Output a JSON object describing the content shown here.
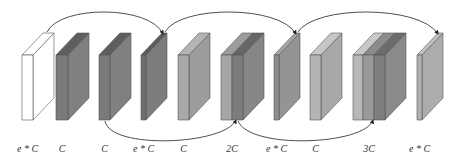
{
  "diagram": {
    "blocks": [
      {
        "id": "b1",
        "label": "e * C",
        "x": 22,
        "slabs": [
          {
            "w": 11,
            "front": "#ffffff",
            "side": "#ffffff",
            "top": "#ffffff"
          }
        ]
      },
      {
        "id": "b2",
        "label": "C",
        "x": 56,
        "slabs": [
          {
            "w": 12,
            "front": "#7a7a7a",
            "side": "#808080",
            "top": "#5e5e5e"
          }
        ]
      },
      {
        "id": "b3",
        "label": "C",
        "x": 99,
        "slabs": [
          {
            "w": 11,
            "front": "#7a7a7a",
            "side": "#808080",
            "top": "#5e5e5e"
          }
        ]
      },
      {
        "id": "b4",
        "label": "e * C",
        "x": 141,
        "slabs": [
          {
            "w": 5,
            "front": "#6e6e6e",
            "side": "#7c7c7c",
            "top": "#5a5a5a"
          }
        ]
      },
      {
        "id": "b5",
        "label": "C",
        "x": 178,
        "slabs": [
          {
            "w": 11,
            "front": "#a8a8a8",
            "side": "#9c9c9c",
            "top": "#b4b4b4"
          }
        ]
      },
      {
        "id": "b6",
        "label": "2C",
        "x": 221,
        "slabs": [
          {
            "w": 11,
            "front": "#a6a6a6",
            "side": "#8c8c8c",
            "top": "#9c9c9c"
          },
          {
            "w": 11,
            "front": "#7c7c7c",
            "side": "#868686",
            "top": "#666666"
          }
        ]
      },
      {
        "id": "b7",
        "label": "e * C",
        "x": 274,
        "slabs": [
          {
            "w": 5,
            "front": "#8e8e8e",
            "side": "#949494",
            "top": "#a4a4a4"
          }
        ]
      },
      {
        "id": "b8",
        "label": "C",
        "x": 310,
        "slabs": [
          {
            "w": 11,
            "front": "#b4b4b4",
            "side": "#a8a8a8",
            "top": "#c6c6c6"
          }
        ]
      },
      {
        "id": "b9",
        "label": "3C",
        "x": 353,
        "slabs": [
          {
            "w": 10,
            "front": "#b8b8b8",
            "side": "#8a8a8a",
            "top": "#c8c8c8"
          },
          {
            "w": 11,
            "front": "#9a9a9a",
            "side": "#8a8a8a",
            "top": "#8c8c8c"
          },
          {
            "w": 11,
            "front": "#7e7e7e",
            "side": "#8a8a8a",
            "top": "#6c6c6c"
          }
        ]
      },
      {
        "id": "b10",
        "label": "e * C",
        "x": 417,
        "slabs": [
          {
            "w": 5,
            "front": "#b0b0b0",
            "side": "#acacac",
            "top": "#c2c2c2"
          }
        ]
      }
    ],
    "geometry": {
      "front_top": 55,
      "front_bottom": 120,
      "depth_dx": 21,
      "depth_dy": -22
    },
    "top_arrows": [
      {
        "from": "b1",
        "to": "b4",
        "path": "M 47 32 C 60 5, 150 5, 163 34"
      },
      {
        "from": "b4",
        "to": "b7",
        "path": "M 165 32 C 180 5, 280 5, 296 34"
      },
      {
        "from": "b7",
        "to": "b10",
        "path": "M 298 32 C 315 5, 420 5, 438 34"
      }
    ],
    "bottom_arrows": [
      {
        "from": "b3",
        "to": "b6",
        "path": "M 105 121 C 110 150, 225 145, 236 120"
      },
      {
        "from": "b6",
        "to": "b9",
        "path": "M 238 121 C 250 150, 365 145, 373 120"
      }
    ],
    "colors": {
      "stroke": "#3a3a3a",
      "edge": "#555555",
      "label": "#333333"
    }
  }
}
